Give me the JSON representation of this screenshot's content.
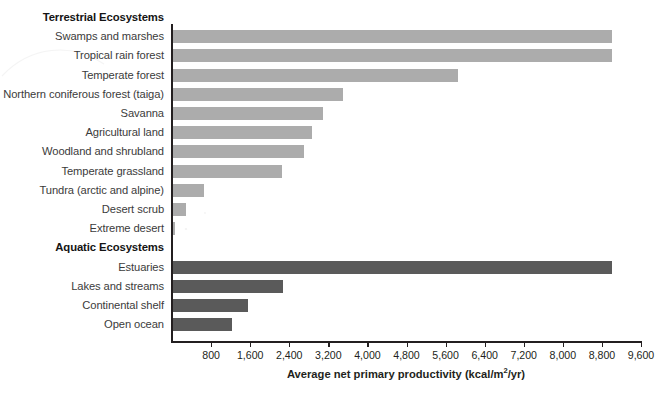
{
  "chart_data": {
    "type": "bar",
    "orientation": "horizontal",
    "title": "",
    "xlabel": "Average net primary productivity (kcal/m2/yr)",
    "xlabel_parts": {
      "before": "Average net primary productivity (kcal/m",
      "sup": "2",
      "after": "/yr)"
    },
    "ylabel": "",
    "xlim": [
      0,
      9600
    ],
    "xtick_step": 800,
    "xticks": [
      800,
      1600,
      2400,
      3200,
      4000,
      4800,
      5600,
      6400,
      7200,
      8000,
      8800,
      9600
    ],
    "xtick_labels": [
      "800",
      "1,600",
      "2,400",
      "3,200",
      "4,000",
      "4,800",
      "5,600",
      "6,400",
      "7,200",
      "8,000",
      "8,800",
      "9,600"
    ],
    "grid": false,
    "legend": "none",
    "colors": {
      "terrestrial": "#acacac",
      "aquatic": "#5a5a5a",
      "axis": "#231f20",
      "label_text": "#3b3b3b",
      "background": "#ffffff"
    },
    "groups": [
      {
        "name": "Terrestrial Ecosystems",
        "series_key": "terrestrial",
        "categories": [
          "Swamps and marshes",
          "Tropical rain forest",
          "Temperate forest",
          "Northern coniferous forest (taiga)",
          "Savanna",
          "Agricultural land",
          "Woodland and shrubland",
          "Temperate grassland",
          "Tundra (arctic and alpine)",
          "Desert scrub",
          "Extreme desert"
        ],
        "values": [
          9000,
          9000,
          5850,
          3500,
          3100,
          2860,
          2700,
          2250,
          650,
          280,
          60
        ]
      },
      {
        "name": "Aquatic Ecosystems",
        "series_key": "aquatic",
        "categories": [
          "Estuaries",
          "Lakes and streams",
          "Continental shelf",
          "Open ocean"
        ],
        "values": [
          9000,
          2270,
          1560,
          1230
        ]
      }
    ],
    "rows": [
      {
        "kind": "group",
        "label": "Terrestrial Ecosystems",
        "value": null,
        "series": null
      },
      {
        "kind": "bar",
        "label": "Swamps and marshes",
        "value": 9000,
        "series": "terrestrial"
      },
      {
        "kind": "bar",
        "label": "Tropical rain forest",
        "value": 9000,
        "series": "terrestrial"
      },
      {
        "kind": "bar",
        "label": "Temperate forest",
        "value": 5850,
        "series": "terrestrial"
      },
      {
        "kind": "bar",
        "label": "Northern coniferous forest (taiga)",
        "value": 3500,
        "series": "terrestrial"
      },
      {
        "kind": "bar",
        "label": "Savanna",
        "value": 3100,
        "series": "terrestrial"
      },
      {
        "kind": "bar",
        "label": "Agricultural land",
        "value": 2860,
        "series": "terrestrial"
      },
      {
        "kind": "bar",
        "label": "Woodland and shrubland",
        "value": 2700,
        "series": "terrestrial"
      },
      {
        "kind": "bar",
        "label": "Temperate grassland",
        "value": 2250,
        "series": "terrestrial"
      },
      {
        "kind": "bar",
        "label": "Tundra (arctic and alpine)",
        "value": 650,
        "series": "terrestrial"
      },
      {
        "kind": "bar",
        "label": "Desert scrub",
        "value": 280,
        "series": "terrestrial"
      },
      {
        "kind": "bar",
        "label": "Extreme desert",
        "value": 60,
        "series": "terrestrial"
      },
      {
        "kind": "group",
        "label": "Aquatic Ecosystems",
        "value": null,
        "series": null
      },
      {
        "kind": "bar",
        "label": "Estuaries",
        "value": 9000,
        "series": "aquatic"
      },
      {
        "kind": "bar",
        "label": "Lakes and streams",
        "value": 2270,
        "series": "aquatic"
      },
      {
        "kind": "bar",
        "label": "Continental shelf",
        "value": 1560,
        "series": "aquatic"
      },
      {
        "kind": "bar",
        "label": "Open ocean",
        "value": 1230,
        "series": "aquatic"
      }
    ]
  },
  "layout": {
    "plot_left_px": 172,
    "plot_right_px": 641,
    "first_row_top_px": 8,
    "row_height_px": 19.2,
    "axis_top_px": 24,
    "axis_bottom_px": 341
  }
}
